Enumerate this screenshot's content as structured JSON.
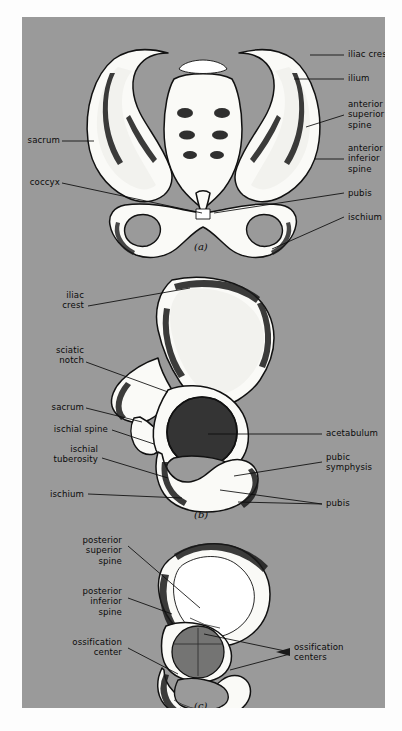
{
  "figure": {
    "background_color": "#9a9a9a",
    "text_color": "#0b0b0b",
    "panels": [
      {
        "caption": "(a)",
        "view": "anterior view of the pelvis",
        "labels_left": [
          {
            "text": "sacrum"
          },
          {
            "text": "coccyx"
          }
        ],
        "labels_right": [
          {
            "text": "iliac crest"
          },
          {
            "text": "ilium"
          },
          {
            "text": "anterior\nsuperior\nspine"
          },
          {
            "text": "anterior\ninferior\nspine"
          },
          {
            "text": "pubis"
          },
          {
            "text": "ischium"
          }
        ]
      },
      {
        "caption": "(b)",
        "view": "lateral view of the hip bone",
        "labels_left": [
          {
            "text": "iliac\ncrest"
          },
          {
            "text": "sciatic\nnotch"
          },
          {
            "text": "sacrum"
          },
          {
            "text": "ischial spine"
          },
          {
            "text": "ischial\ntuberosity"
          },
          {
            "text": "ischium"
          }
        ],
        "labels_right": [
          {
            "text": "acetabulum"
          },
          {
            "text": "pubic\nsymphysis"
          },
          {
            "text": "pubis"
          }
        ]
      },
      {
        "caption": "(c)",
        "view": "juvenile hip bone with ossification centers",
        "labels_left": [
          {
            "text": "posterior\nsuperior\nspine"
          },
          {
            "text": "posterior\ninferior\nspine"
          },
          {
            "text": "ossification\ncenter"
          }
        ],
        "labels_right": [
          {
            "text": "ossification\ncenters"
          }
        ]
      }
    ]
  }
}
